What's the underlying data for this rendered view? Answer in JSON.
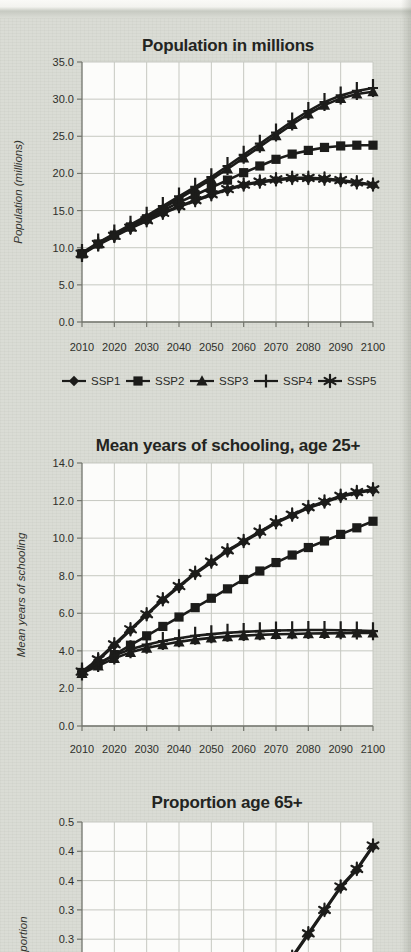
{
  "page": {
    "background": "#dadcd5",
    "plot_background": "#fcfcfa",
    "ink": "#1c1c1a",
    "grid_color": "#c6c8c1",
    "axis_color": "#72746c"
  },
  "chart_data": [
    {
      "type": "line",
      "title": "Population in millions",
      "ylabel": "Population (millions)",
      "ylim": [
        0,
        35
      ],
      "ytick_labels": [
        "35.0",
        "30.0",
        "25.0",
        "20.0",
        "15.0",
        "10.0",
        "5.0",
        "0.0"
      ],
      "xtick_labels": [
        "2010",
        "2020",
        "2030",
        "2040",
        "2050",
        "2060",
        "2070",
        "2080",
        "2090",
        "2100"
      ],
      "xlim": [
        2010,
        2100
      ],
      "grid": true,
      "legend_position": "bottom",
      "x": [
        2010,
        2015,
        2020,
        2025,
        2030,
        2035,
        2040,
        2045,
        2050,
        2055,
        2060,
        2065,
        2070,
        2075,
        2080,
        2085,
        2090,
        2095,
        2100
      ],
      "series": [
        {
          "name": "SSP1",
          "marker": "diamond",
          "values": [
            9.1,
            10.4,
            11.5,
            12.6,
            13.6,
            14.6,
            15.5,
            16.3,
            17.1,
            17.8,
            18.4,
            18.8,
            19.1,
            19.3,
            19.3,
            19.2,
            19.0,
            18.7,
            18.4
          ]
        },
        {
          "name": "SSP2",
          "marker": "square",
          "values": [
            9.2,
            10.5,
            11.7,
            12.8,
            13.9,
            15.0,
            16.1,
            17.1,
            18.1,
            19.1,
            20.1,
            21.0,
            21.9,
            22.6,
            23.1,
            23.5,
            23.7,
            23.8,
            23.8
          ]
        },
        {
          "name": "SSP3",
          "marker": "triangle",
          "values": [
            9.2,
            10.6,
            11.8,
            12.9,
            14.1,
            15.3,
            16.6,
            17.9,
            19.2,
            20.6,
            22.1,
            23.6,
            25.1,
            26.6,
            28.0,
            29.2,
            30.1,
            30.7,
            31.0
          ]
        },
        {
          "name": "SSP4",
          "marker": "plus",
          "values": [
            9.3,
            10.7,
            11.9,
            13.1,
            14.3,
            15.6,
            16.9,
            18.2,
            19.5,
            21.0,
            22.5,
            24.0,
            25.5,
            27.0,
            28.4,
            29.6,
            30.5,
            31.1,
            31.5
          ]
        },
        {
          "name": "SSP5",
          "marker": "asterisk",
          "values": [
            9.2,
            10.5,
            11.6,
            12.7,
            13.7,
            14.7,
            15.6,
            16.4,
            17.2,
            17.9,
            18.5,
            18.9,
            19.2,
            19.4,
            19.4,
            19.3,
            19.1,
            18.8,
            18.5
          ]
        }
      ],
      "legend_items": [
        "SSP1",
        "SSP2",
        "SSP3",
        "SSP4",
        "SSP5"
      ]
    },
    {
      "type": "line",
      "title": "Mean years of schooling, age 25+",
      "ylabel": "Mean years of schooling",
      "ylim": [
        0,
        14
      ],
      "ytick_labels": [
        "14.0",
        "12.0",
        "10.0",
        "8.0",
        "6.0",
        "4.0",
        "2.0",
        "0.0"
      ],
      "xtick_labels": [
        "2010",
        "2020",
        "2030",
        "2040",
        "2050",
        "2060",
        "2070",
        "2080",
        "2090",
        "2100"
      ],
      "xlim": [
        2010,
        2100
      ],
      "grid": true,
      "legend_position": "none",
      "x": [
        2010,
        2015,
        2020,
        2025,
        2030,
        2035,
        2040,
        2045,
        2050,
        2055,
        2060,
        2065,
        2070,
        2075,
        2080,
        2085,
        2090,
        2095,
        2100
      ],
      "series": [
        {
          "name": "SSP1",
          "marker": "diamond",
          "values": [
            2.85,
            3.5,
            4.3,
            5.1,
            5.9,
            6.7,
            7.4,
            8.1,
            8.7,
            9.3,
            9.8,
            10.3,
            10.8,
            11.2,
            11.6,
            11.9,
            12.2,
            12.4,
            12.55
          ]
        },
        {
          "name": "SSP2",
          "marker": "square",
          "values": [
            2.85,
            3.3,
            3.8,
            4.3,
            4.8,
            5.3,
            5.8,
            6.3,
            6.8,
            7.3,
            7.8,
            8.25,
            8.7,
            9.1,
            9.5,
            9.85,
            10.2,
            10.55,
            10.9
          ]
        },
        {
          "name": "SSP3",
          "marker": "triangle",
          "values": [
            2.8,
            3.2,
            3.6,
            3.92,
            4.15,
            4.33,
            4.48,
            4.6,
            4.69,
            4.76,
            4.81,
            4.85,
            4.88,
            4.9,
            4.92,
            4.93,
            4.94,
            4.95,
            4.95
          ]
        },
        {
          "name": "SSP4",
          "marker": "plus",
          "values": [
            2.9,
            3.35,
            3.75,
            4.08,
            4.33,
            4.52,
            4.67,
            4.8,
            4.89,
            4.96,
            5.01,
            5.05,
            5.08,
            5.1,
            5.11,
            5.11,
            5.1,
            5.08,
            5.05
          ]
        },
        {
          "name": "SSP5",
          "marker": "asterisk",
          "values": [
            2.9,
            3.55,
            4.35,
            5.15,
            5.95,
            6.75,
            7.45,
            8.15,
            8.75,
            9.35,
            9.85,
            10.35,
            10.85,
            11.25,
            11.65,
            11.95,
            12.25,
            12.45,
            12.6
          ]
        }
      ],
      "legend_items": []
    },
    {
      "type": "line",
      "title": "Proportion age 65+",
      "ylabel": "Proportion",
      "ylim": [
        0,
        0.5
      ],
      "ytick_labels": [
        "0.5",
        "0.4",
        "0.4",
        "0.3",
        "0.3"
      ],
      "xtick_labels": [],
      "xlim": [
        2010,
        2100
      ],
      "grid": true,
      "legend_position": "none",
      "x": [
        2070,
        2075,
        2080,
        2085,
        2090,
        2095,
        2100
      ],
      "series": [
        {
          "name": "SSP1",
          "marker": "diamond",
          "values": [
            0.228,
            0.268,
            0.308,
            0.348,
            0.388,
            0.418,
            0.458
          ]
        },
        {
          "name": "SSP5",
          "marker": "asterisk",
          "values": [
            0.23,
            0.27,
            0.31,
            0.35,
            0.39,
            0.42,
            0.46
          ]
        }
      ],
      "legend_items": []
    }
  ]
}
